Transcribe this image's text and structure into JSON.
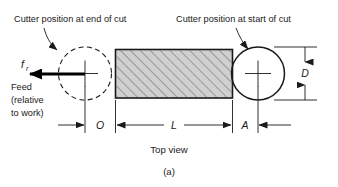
{
  "figure": {
    "caption": "(a)",
    "view_label": "Top view",
    "annotations": {
      "left_callout": "Cutter position at end of cut",
      "right_callout": "Cutter position at start of cut"
    },
    "feed": {
      "symbol_base": "f",
      "symbol_subscript": "r",
      "line1": "Feed",
      "line2": "(relative",
      "line3": "to work)"
    },
    "dimensions": {
      "overtravel": "O",
      "length": "L",
      "approach": "A",
      "diameter": "D"
    },
    "colors": {
      "line": "#1a1a1a",
      "workpiece_fill": "#d0d0d0",
      "hatch": "#4a4a4a",
      "background": "#ffffff"
    },
    "icons": {
      "left_cutter": "dashed-circle-icon",
      "right_cutter": "solid-circle-icon",
      "feed_direction": "left-arrow-icon"
    }
  }
}
